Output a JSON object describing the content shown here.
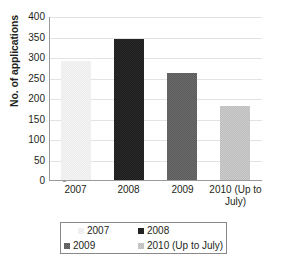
{
  "chart_data": {
    "type": "bar",
    "title": "",
    "xlabel": "",
    "ylabel": "No. of applications",
    "categories": [
      "2007",
      "2008",
      "2009",
      "2010 (Up to July)"
    ],
    "values": [
      290,
      345,
      260,
      180
    ],
    "ylim": [
      0,
      400
    ],
    "ytick_step": 50,
    "yticks": [
      "400",
      "350",
      "300",
      "250",
      "200",
      "150",
      "100",
      "50",
      "0"
    ],
    "ytick_values": [
      400,
      350,
      300,
      250,
      200,
      150,
      100,
      50,
      0
    ],
    "grid": "horizontal",
    "legend_position": "bottom",
    "series": [
      {
        "name": "2007",
        "value": 290,
        "color": "#f4f4f4"
      },
      {
        "name": "2008",
        "value": 345,
        "color": "#1c1c1c"
      },
      {
        "name": "2009",
        "value": 260,
        "color": "#5b5b5b"
      },
      {
        "name": "2010 (Up to July)",
        "value": 180,
        "color": "#cccccc"
      }
    ]
  },
  "axis": {
    "y_title": "No. of applications",
    "x_tick_labels": [
      {
        "line1": "2007",
        "line2": ""
      },
      {
        "line1": "2008",
        "line2": ""
      },
      {
        "line1": "2009",
        "line2": ""
      },
      {
        "line1": "2010 (Up to",
        "line2": "July)"
      }
    ]
  },
  "legend": {
    "entries": [
      {
        "label": "2007",
        "color": "#f4f4f4"
      },
      {
        "label": "2008",
        "color": "#1c1c1c"
      },
      {
        "label": "2009",
        "color": "#5b5b5b"
      },
      {
        "label": "2010 (Up to July)",
        "color": "#cccccc"
      }
    ]
  },
  "colors": {
    "axis_line": "#9a9a9a",
    "gridline": "#e3e3e3",
    "text": "#231f20",
    "background": "#ffffff",
    "legend_border": "#888888"
  }
}
